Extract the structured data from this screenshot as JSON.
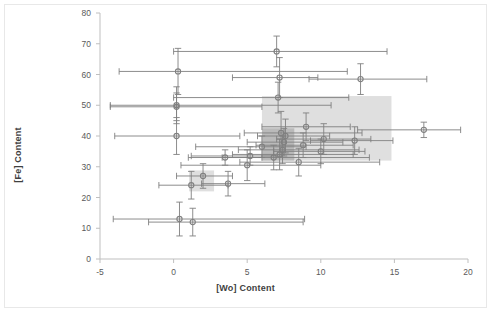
{
  "chart_data": {
    "type": "scatter",
    "title": "",
    "xlabel": "[Wo] Content",
    "ylabel": "[Fe] Content",
    "xlim": [
      -5,
      20
    ],
    "ylim": [
      0,
      80
    ],
    "xticks": [
      -5,
      0,
      5,
      10,
      15,
      20
    ],
    "yticks": [
      0,
      10,
      20,
      30,
      40,
      50,
      60,
      70,
      80
    ],
    "grid": false,
    "legend": "none",
    "marker": "open-circle",
    "error_bars": "both-xy",
    "series": [
      {
        "name": "Samples",
        "points": [
          {
            "x": 7.0,
            "y": 67.5,
            "xerr_low": 7.0,
            "xerr_high": 7.5,
            "yerr": 5.0
          },
          {
            "x": 0.3,
            "y": 61.0,
            "xerr_low": 4.0,
            "xerr_high": 11.5,
            "yerr": 7.5
          },
          {
            "x": 7.2,
            "y": 59.0,
            "xerr_low": 3.2,
            "xerr_high": 2.6,
            "yerr": 6.5
          },
          {
            "x": 12.7,
            "y": 58.5,
            "xerr_low": 3.5,
            "xerr_high": 4.5,
            "yerr": 5.0
          },
          {
            "x": 7.1,
            "y": 52.5,
            "xerr_low": 7.1,
            "xerr_high": 4.8,
            "yerr": 5.0
          },
          {
            "x": 0.2,
            "y": 50.0,
            "xerr_low": 4.5,
            "xerr_high": 10.5,
            "yerr": 6.0
          },
          {
            "x": 0.2,
            "y": 49.5,
            "xerr_low": 4.5,
            "xerr_high": 5.8,
            "yerr": 4.5
          },
          {
            "x": 0.2,
            "y": 40.0,
            "xerr_low": 4.2,
            "xerr_high": 4.3,
            "yerr": 6.0
          },
          {
            "x": 9.0,
            "y": 43.0,
            "xerr_low": 3.0,
            "xerr_high": 3.0,
            "yerr": 4.5
          },
          {
            "x": 17.0,
            "y": 42.0,
            "xerr_low": 4.5,
            "xerr_high": 2.5,
            "yerr": 2.5
          },
          {
            "x": 7.3,
            "y": 41.0,
            "xerr_low": 2.5,
            "xerr_high": 5.5,
            "yerr": 7.0
          },
          {
            "x": 7.6,
            "y": 40.0,
            "xerr_low": 1.9,
            "xerr_high": 3.0,
            "yerr": 5.5
          },
          {
            "x": 10.2,
            "y": 39.0,
            "xerr_low": 3.2,
            "xerr_high": 3.2,
            "yerr": 5.0
          },
          {
            "x": 7.5,
            "y": 38.0,
            "xerr_low": 2.5,
            "xerr_high": 4.0,
            "yerr": 4.5
          },
          {
            "x": 12.3,
            "y": 38.5,
            "xerr_low": 3.0,
            "xerr_high": 2.6,
            "yerr": 4.5
          },
          {
            "x": 8.8,
            "y": 37.0,
            "xerr_low": 3.2,
            "xerr_high": 3.4,
            "yerr": 4.0
          },
          {
            "x": 6.0,
            "y": 36.5,
            "xerr_low": 4.5,
            "xerr_high": 3.0,
            "yerr": 3.5
          },
          {
            "x": 7.4,
            "y": 35.5,
            "xerr_low": 3.0,
            "xerr_high": 5.2,
            "yerr": 4.5
          },
          {
            "x": 10.0,
            "y": 35.0,
            "xerr_low": 3.2,
            "xerr_high": 3.0,
            "yerr": 4.0
          },
          {
            "x": 7.2,
            "y": 34.0,
            "xerr_low": 3.2,
            "xerr_high": 5.0,
            "yerr": 5.0
          },
          {
            "x": 5.2,
            "y": 33.5,
            "xerr_low": 4.0,
            "xerr_high": 2.2,
            "yerr": 3.0
          },
          {
            "x": 6.8,
            "y": 33.0,
            "xerr_low": 3.5,
            "xerr_high": 6.5,
            "yerr": 4.0
          },
          {
            "x": 3.5,
            "y": 33.0,
            "xerr_low": 2.5,
            "xerr_high": 2.5,
            "yerr": 2.5
          },
          {
            "x": 8.5,
            "y": 31.5,
            "xerr_low": 4.0,
            "xerr_high": 5.5,
            "yerr": 4.5
          },
          {
            "x": 5.0,
            "y": 30.5,
            "xerr_low": 4.5,
            "xerr_high": 5.0,
            "yerr": 5.0
          },
          {
            "x": 2.0,
            "y": 27.0,
            "xerr_low": 1.8,
            "xerr_high": 2.0,
            "yerr": 4.0
          },
          {
            "x": 1.2,
            "y": 24.0,
            "xerr_low": 2.2,
            "xerr_high": 2.5,
            "yerr": 4.5
          },
          {
            "x": 3.7,
            "y": 24.5,
            "xerr_low": 1.8,
            "xerr_high": 2.5,
            "yerr": 4.0
          },
          {
            "x": 0.4,
            "y": 13.0,
            "xerr_low": 4.5,
            "xerr_high": 8.5,
            "yerr": 5.5
          },
          {
            "x": 1.3,
            "y": 12.0,
            "xerr_low": 3.0,
            "xerr_high": 7.5,
            "yerr": 4.5
          }
        ]
      }
    ],
    "shaded_regions": [
      {
        "name": "main-field",
        "x0": 6.0,
        "x1": 14.8,
        "y0": 32.0,
        "y1": 53.0,
        "color": "#d9d9d9"
      },
      {
        "name": "core-field",
        "x0": 6.0,
        "x1": 8.2,
        "y0": 32.0,
        "y1": 42.5,
        "color": "#b4b4b4"
      },
      {
        "name": "low-field",
        "x0": 1.05,
        "x1": 2.75,
        "y0": 22.0,
        "y1": 28.8,
        "color": "#d9d9d9"
      }
    ]
  },
  "axes": {
    "x_title": "[Wo] Content",
    "y_title": "[Fe] Content",
    "x_tick_labels": [
      "-5",
      "0",
      "5",
      "10",
      "15",
      "20"
    ],
    "y_tick_labels": [
      "0",
      "10",
      "20",
      "30",
      "40",
      "50",
      "60",
      "70",
      "80"
    ]
  },
  "style": {
    "marker_stroke": "#808080",
    "errorbar_color": "#808080",
    "axis_color": "#bfbfbf",
    "tick_text_color": "#5a5a5a",
    "title_color": "#3f3f3f",
    "background": "#ffffff"
  }
}
